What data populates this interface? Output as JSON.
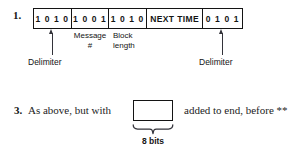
{
  "figure": {
    "items": [
      {
        "number": "1.",
        "frame_cells": [
          {
            "text": "1 0 1 0"
          },
          {
            "text": "1 0 0 1"
          },
          {
            "text": "1 0 1 0"
          },
          {
            "text": "NEXT TIME"
          },
          {
            "text": "0 1 0 1"
          }
        ],
        "callouts": {
          "message_label_line1": "Message",
          "message_label_line2": "#",
          "block_label_line1": "Block",
          "block_label_line2": "length",
          "delimiter_left": "Delimiter",
          "delimiter_right": "Delimiter"
        }
      },
      {
        "number": "3.",
        "text_before_box": "As above, but with",
        "text_after_box": "added to end, before **",
        "brace_label": "8 bits"
      }
    ],
    "colors": {
      "ink": "#141414",
      "line": "#33333a",
      "background": "#ffffff"
    }
  }
}
